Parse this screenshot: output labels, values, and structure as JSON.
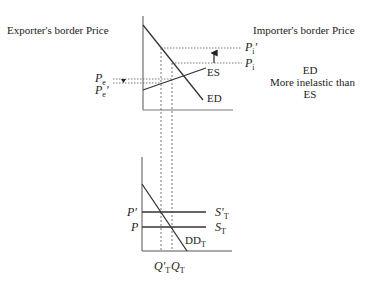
{
  "diagram": {
    "top_panel": {
      "left_title": "Exporter's border Price",
      "right_title": "Importer's border Price",
      "curves": {
        "ed": "ED",
        "es": "ES"
      },
      "price_labels": {
        "pi_prime": "P",
        "pi_prime_sub": "i",
        "pi_prime_mark": "′",
        "pi": "P",
        "pi_sub": "i",
        "pe": "P",
        "pe_sub": "e",
        "pe_prime": "P",
        "pe_prime_sub": "e",
        "pe_prime_mark": "′"
      },
      "note": [
        "ED",
        "More inelastic than",
        "ES"
      ]
    },
    "bottom_panel": {
      "curves": {
        "s_prime": "S′",
        "s_prime_sub": "T",
        "s": "S",
        "s_sub": "T",
        "dd": "DD",
        "dd_sub": "T"
      },
      "price_labels": {
        "p_prime": "P′",
        "p": "P"
      },
      "quantity_labels": {
        "q_prime": "Q′",
        "q_prime_sub": "T",
        "q": "Q",
        "q_sub": "T"
      }
    },
    "colors": {
      "line": "#333333",
      "axis": "#555555",
      "text": "#222222"
    }
  }
}
